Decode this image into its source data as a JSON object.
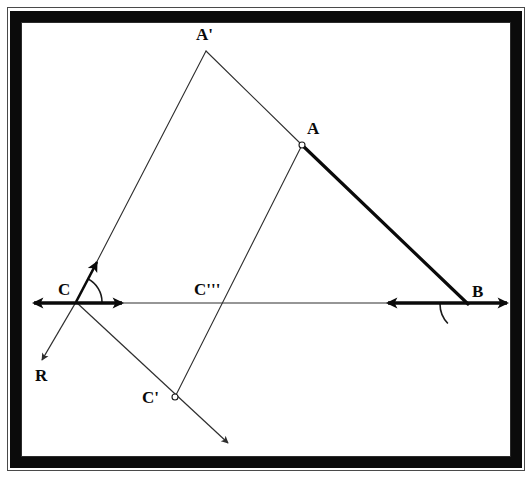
{
  "figure": {
    "type": "geometry-diagram",
    "title": "",
    "background": "#ffffff",
    "frame": {
      "style": "photo-border",
      "band_color": "#0b0b0b",
      "rule_color": "#2b2b2b"
    },
    "stroke_colors": {
      "thin": "#2e2e2e",
      "thick": "#0a0a0a",
      "arc": "#1a1a1a"
    }
  },
  "points": [
    {
      "id": "A",
      "label": "A",
      "x": 302,
      "y": 145,
      "marker": "open-circle",
      "label_x": 307,
      "label_y": 120
    },
    {
      "id": "Ap",
      "label": "A'",
      "x": 206,
      "y": 51,
      "marker": "none",
      "label_x": 196,
      "label_y": 26
    },
    {
      "id": "B",
      "label": "B",
      "x": 468,
      "y": 304,
      "marker": "none",
      "label_x": 472,
      "label_y": 283
    },
    {
      "id": "C",
      "label": "C",
      "x": 76,
      "y": 302,
      "marker": "none",
      "label_x": 58,
      "label_y": 281
    },
    {
      "id": "Cp",
      "label": "C'",
      "x": 175,
      "y": 397,
      "marker": "open-circle",
      "label_x": 142,
      "label_y": 389
    },
    {
      "id": "Cpp",
      "label": "C'''",
      "x": 223,
      "y": 303,
      "marker": "none",
      "label_x": 194,
      "label_y": 281
    },
    {
      "id": "R",
      "label": "R",
      "x": 42,
      "y": 362,
      "marker": "none",
      "label_x": 35,
      "label_y": 367
    }
  ],
  "segments": [
    {
      "id": "seg-Ap-A",
      "name": "segment-A-prime-to-A",
      "x1": 206,
      "y1": 51,
      "x2": 302,
      "y2": 145,
      "width": 1.1,
      "color": "#2e2e2e"
    },
    {
      "id": "seg-A-B",
      "name": "segment-A-to-B",
      "x1": 302,
      "y1": 145,
      "x2": 468,
      "y2": 304,
      "width": 3.2,
      "color": "#0a0a0a"
    },
    {
      "id": "seg-Ap-C",
      "name": "segment-A-prime-to-C",
      "x1": 206,
      "y1": 51,
      "x2": 76,
      "y2": 302,
      "width": 1.1,
      "color": "#2e2e2e"
    },
    {
      "id": "seg-A-Cp",
      "name": "segment-A-to-C-prime",
      "x1": 302,
      "y1": 145,
      "x2": 175,
      "y2": 397,
      "width": 1.1,
      "color": "#2e2e2e"
    },
    {
      "id": "seg-base",
      "name": "baseline-C-to-B",
      "x1": 118,
      "y1": 303,
      "x2": 392,
      "y2": 303,
      "width": 1.2,
      "color": "#2e2e2e"
    }
  ],
  "rays": [
    {
      "id": "ray-C-up",
      "name": "ray-C-toward-A-prime",
      "x1": 76,
      "y1": 302,
      "x2": 97,
      "y2": 262,
      "width": 2.6,
      "color": "#0a0a0a",
      "arrow": "end"
    },
    {
      "id": "ray-C-R",
      "name": "ray-C-to-R",
      "x1": 76,
      "y1": 302,
      "x2": 42,
      "y2": 360,
      "width": 1.3,
      "color": "#2e2e2e",
      "arrow": "end"
    },
    {
      "id": "ray-Cp-down",
      "name": "ray-through-C-prime",
      "x1": 76,
      "y1": 302,
      "x2": 228,
      "y2": 443,
      "width": 1.2,
      "color": "#2e2e2e",
      "arrow": "end"
    }
  ],
  "double_arrows": [
    {
      "id": "arrow-C",
      "name": "double-arrow-at-C",
      "x1": 34,
      "y1": 303,
      "x2": 122,
      "y2": 303,
      "width": 3.4,
      "color": "#0a0a0a"
    },
    {
      "id": "arrow-B",
      "name": "double-arrow-at-B",
      "x1": 388,
      "y1": 303,
      "x2": 507,
      "y2": 303,
      "width": 3.4,
      "color": "#0a0a0a"
    }
  ],
  "angle_arcs": [
    {
      "id": "arc-C",
      "name": "angle-arc-at-C",
      "cx": 76,
      "cy": 302,
      "r": 26,
      "start_deg": -62,
      "end_deg": 0,
      "width": 1.6,
      "color": "#1a1a1a"
    },
    {
      "id": "arc-B",
      "name": "angle-arc-at-B",
      "cx": 468,
      "cy": 304,
      "r": 28,
      "start_deg": 180,
      "end_deg": 136,
      "width": 1.6,
      "color": "#1a1a1a"
    }
  ],
  "label_style": {
    "font_size_px": 17,
    "prime_font_size_px": 17
  }
}
